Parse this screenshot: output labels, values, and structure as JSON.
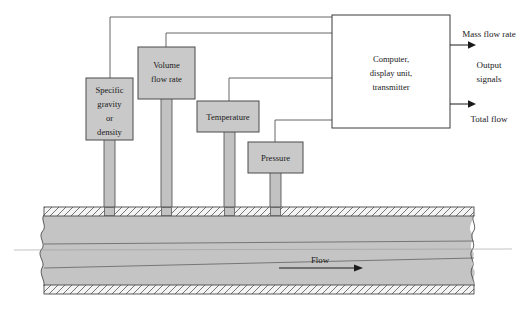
{
  "diagram": {
    "colors": {
      "sensor_box_fill": "#c9c9c9",
      "sensor_box_stroke": "#4a4a4a",
      "pipe_fill": "#c4c4c4",
      "pipe_wall_fill": "#f2f2f2",
      "line_stroke": "#555555",
      "text": "#1a1a1a",
      "background": "#ffffff"
    },
    "sensors": [
      {
        "name": "specific-gravity-or-density",
        "lines": [
          "Specific",
          "gravity",
          "or",
          "density"
        ]
      },
      {
        "name": "volume-flow-rate",
        "lines": [
          "Volume",
          "flow rate"
        ]
      },
      {
        "name": "temperature",
        "lines": [
          "Temperature"
        ]
      },
      {
        "name": "pressure",
        "lines": [
          "Pressure"
        ]
      }
    ],
    "computer": {
      "name": "computer-display-transmitter",
      "lines": [
        "Computer,",
        "display unit,",
        "transmitter"
      ]
    },
    "outputs": [
      {
        "name": "mass-flow-rate-output",
        "label": "Mass flow rate"
      },
      {
        "name": "total-flow-output",
        "label": "Total flow"
      }
    ],
    "output_group_label": "Output signals",
    "pipe": {
      "name": "process-pipe",
      "flow_label": "Flow",
      "flow_direction": "right"
    }
  }
}
